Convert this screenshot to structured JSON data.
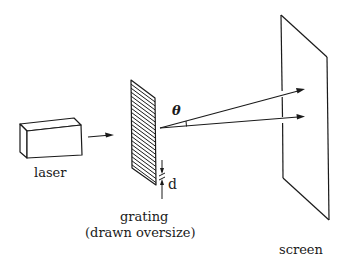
{
  "diagram": {
    "labels": {
      "laser": "laser",
      "grating_line1": "grating",
      "grating_line2": "(drawn oversize)",
      "screen": "screen",
      "spacing": "d",
      "angle": "θ"
    },
    "components": [
      {
        "id": "laser",
        "shape": "rectangular box",
        "position": "left"
      },
      {
        "id": "grating",
        "shape": "hatched parallelogram",
        "position": "center",
        "hatch_lines": 22
      },
      {
        "id": "screen",
        "shape": "parallelogram",
        "position": "right"
      }
    ],
    "rays": [
      {
        "from": "grating",
        "to": "screen",
        "kind": "undeflected"
      },
      {
        "from": "grating",
        "to": "screen",
        "kind": "diffracted",
        "angle_label": "θ"
      }
    ],
    "colors": {
      "stroke": "#1a1a1a",
      "background": "#ffffff"
    }
  }
}
